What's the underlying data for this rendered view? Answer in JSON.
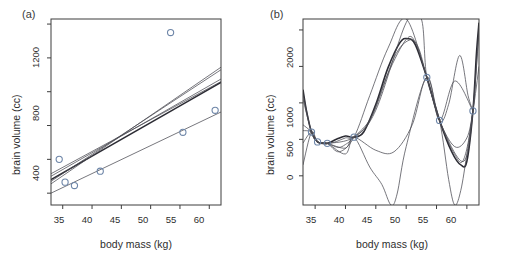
{
  "figure": {
    "panels": [
      {
        "tag": "(a)",
        "axis": {
          "xlabel": "body mass (kg)",
          "ylabel": "brain volume (cc)",
          "xticks": [
            35,
            40,
            45,
            50,
            55,
            60
          ],
          "xticklabels": [
            "35",
            "40",
            "45",
            "50",
            "55",
            "60"
          ],
          "yticks": [
            400,
            800,
            1200
          ],
          "yticklabels": [
            "400",
            "800",
            "1200"
          ],
          "yminorticks": [
            600,
            1000,
            1400
          ],
          "xlim": [
            33.0,
            62.0
          ],
          "ylim": [
            330,
            1430
          ]
        }
      },
      {
        "tag": "(b)",
        "axis": {
          "xlabel": "body mass (kg)",
          "ylabel": "brain volume (cc)",
          "xticks": [
            35,
            40,
            45,
            50,
            55,
            60
          ],
          "xticklabels": [
            "35",
            "40",
            "45",
            "50",
            "55",
            "60"
          ],
          "yticks": [
            0,
            500,
            1000,
            2000
          ],
          "yticklabels": [
            "0",
            "500",
            "1000",
            "2000"
          ],
          "yminorticks": [
            1500
          ],
          "xlim": [
            33.0,
            62.0
          ],
          "ylim": [
            -400,
            2150
          ]
        }
      }
    ]
  },
  "chart_data": [
    {
      "type": "scatter",
      "panel": "(a)",
      "title": "",
      "xlabel": "body mass (kg)",
      "ylabel": "brain volume (cc)",
      "xlim": [
        33.0,
        62.0
      ],
      "ylim": [
        330,
        1430
      ],
      "grid": false,
      "legend": "none",
      "marker": "open-circle",
      "marker_color": "#6e86a8",
      "points": [
        {
          "x": 34.4,
          "y": 600
        },
        {
          "x": 35.4,
          "y": 465
        },
        {
          "x": 37.0,
          "y": 445
        },
        {
          "x": 41.4,
          "y": 530
        },
        {
          "x": 53.4,
          "y": 1350
        },
        {
          "x": 55.5,
          "y": 760
        },
        {
          "x": 61.0,
          "y": 890
        }
      ],
      "series": [
        {
          "name": "fit-1-linear",
          "type": "line",
          "x": [
            33.0,
            62.0
          ],
          "values": [
            515,
            1060
          ],
          "style": "thin"
        },
        {
          "name": "fit-2-linear",
          "type": "line",
          "x": [
            33.0,
            62.0
          ],
          "values": [
            500,
            1075
          ],
          "style": "thin"
        },
        {
          "name": "fit-3-linear",
          "type": "line",
          "x": [
            33.0,
            62.0
          ],
          "values": [
            480,
            1055
          ],
          "style": "bold"
        },
        {
          "name": "fit-4-linear",
          "type": "line",
          "x": [
            33.0,
            62.0
          ],
          "values": [
            470,
            1130
          ],
          "style": "thin"
        },
        {
          "name": "fit-5-linear",
          "type": "line",
          "x": [
            33.0,
            62.0
          ],
          "values": [
            455,
            1145
          ],
          "style": "thin"
        },
        {
          "name": "fit-6-linear",
          "type": "line",
          "x": [
            33.0,
            62.0
          ],
          "values": [
            400,
            880
          ],
          "style": "thin"
        }
      ]
    },
    {
      "type": "line",
      "panel": "(b)",
      "title": "",
      "xlabel": "body mass (kg)",
      "ylabel": "brain volume (cc)",
      "xlim": [
        33.0,
        62.0
      ],
      "ylim": [
        -400,
        2150
      ],
      "grid": false,
      "legend": "none",
      "marker": "open-circle",
      "marker_color": "#6e86a8",
      "points": [
        {
          "x": 34.4,
          "y": 600
        },
        {
          "x": 35.4,
          "y": 465
        },
        {
          "x": 37.0,
          "y": 445
        },
        {
          "x": 41.4,
          "y": 530
        },
        {
          "x": 53.4,
          "y": 1350
        },
        {
          "x": 55.5,
          "y": 760
        },
        {
          "x": 61.0,
          "y": 890
        }
      ],
      "series": [
        {
          "name": "poly-fit-main",
          "style": "bold",
          "x": [
            33.0,
            33.6,
            34.4,
            35.4,
            36.2,
            37.0,
            38.5,
            40.0,
            41.4,
            43.0,
            45.0,
            47.0,
            49.0,
            50.2,
            51.5,
            53.4,
            55.5,
            57.5,
            59.0,
            60.0,
            61.0,
            61.6,
            62.0
          ],
          "values": [
            1180,
            880,
            600,
            465,
            448,
            445,
            500,
            545,
            530,
            600,
            980,
            1480,
            1830,
            1880,
            1800,
            1350,
            760,
            330,
            150,
            200,
            890,
            1700,
            2100
          ]
        },
        {
          "name": "poly-fit-2",
          "style": "thin",
          "x": [
            33.0,
            34.4,
            35.4,
            37.0,
            38.5,
            40.0,
            41.4,
            44.0,
            47.0,
            50.0,
            51.5,
            53.4,
            55.5,
            58.0,
            59.5,
            61.0,
            62.0
          ],
          "values": [
            1120,
            600,
            465,
            445,
            470,
            520,
            530,
            760,
            1400,
            1870,
            1830,
            1350,
            760,
            290,
            230,
            890,
            2050
          ]
        },
        {
          "name": "poly-fit-3",
          "style": "thin",
          "x": [
            33.0,
            34.4,
            35.4,
            37.0,
            38.8,
            40.0,
            41.4,
            44.5,
            48.0,
            50.5,
            52.0,
            53.4,
            55.5,
            58.5,
            60.0,
            61.0,
            62.0
          ],
          "values": [
            1050,
            600,
            465,
            445,
            390,
            430,
            530,
            840,
            1620,
            1860,
            1760,
            1350,
            760,
            250,
            280,
            890,
            1980
          ]
        },
        {
          "name": "poly-fit-4-divergent",
          "style": "thin",
          "x": [
            33.0,
            34.4,
            35.4,
            37.0,
            39.0,
            41.4,
            44.0,
            47.0,
            50.0,
            53.4,
            55.5,
            57.0,
            58.8,
            60.2,
            61.0
          ],
          "values": [
            150,
            600,
            465,
            445,
            330,
            530,
            1100,
            1750,
            2150,
            1350,
            760,
            980,
            1650,
            1100,
            890
          ]
        },
        {
          "name": "poly-fit-5-steep",
          "style": "thin",
          "x": [
            33.0,
            34.4,
            35.4,
            37.0,
            40.0,
            41.4,
            44.0,
            46.0,
            47.5,
            48.5,
            50.0,
            53.4,
            55.5,
            58.0,
            61.0
          ],
          "values": [
            700,
            600,
            465,
            445,
            300,
            530,
            120,
            -120,
            -400,
            -250,
            400,
            1350,
            760,
            1300,
            890
          ]
        },
        {
          "name": "poly-fit-6-shallow",
          "style": "thin",
          "x": [
            33.0,
            34.4,
            35.4,
            37.0,
            40.0,
            41.4,
            45.0,
            48.0,
            51.0,
            53.4,
            55.5,
            58.0,
            60.0,
            61.0,
            62.0
          ],
          "values": [
            620,
            600,
            465,
            445,
            380,
            530,
            350,
            330,
            700,
            1350,
            760,
            400,
            520,
            890,
            1500
          ]
        },
        {
          "name": "poly-fit-7-vertical",
          "style": "thin",
          "x": [
            33.0,
            34.4,
            35.4,
            37.0,
            41.4,
            45.0,
            50.0,
            52.5,
            53.4,
            55.5,
            57.0,
            58.0,
            59.0,
            60.0,
            61.0
          ],
          "values": [
            450,
            600,
            465,
            445,
            530,
            900,
            2100,
            2150,
            1350,
            760,
            -50,
            -400,
            -200,
            300,
            890
          ]
        }
      ]
    }
  ]
}
